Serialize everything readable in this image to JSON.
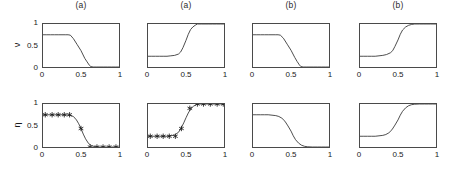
{
  "figure": {
    "rows": [
      {
        "ylabel": "ν"
      },
      {
        "ylabel": "η"
      }
    ],
    "xticks": [
      "0",
      "0.5",
      "1"
    ],
    "yticks": [
      "0",
      "0.5",
      "1"
    ],
    "columns": [
      {
        "title": "(a)"
      },
      {
        "title": "(b)"
      },
      {
        "title": "(c)"
      },
      {
        "title": "(d)"
      }
    ]
  },
  "chart_data": [
    {
      "type": "line",
      "title": "(a)",
      "xlabel": "",
      "ylabel": "ν",
      "xlim": [
        0,
        1
      ],
      "ylim": [
        0,
        1
      ],
      "xticks": [
        0,
        0.5,
        1
      ],
      "yticks": [
        0,
        0.5,
        1
      ],
      "grid": false,
      "legend": false,
      "markers": false,
      "series": [
        {
          "name": "ν",
          "x": [
            0.0,
            0.05,
            0.1,
            0.15,
            0.2,
            0.25,
            0.3,
            0.33,
            0.36,
            0.4,
            0.45,
            0.5,
            0.55,
            0.58,
            0.61,
            0.63,
            0.66,
            0.7,
            0.75,
            0.8,
            0.85,
            0.9,
            0.95,
            1.0
          ],
          "y": [
            0.75,
            0.75,
            0.75,
            0.75,
            0.75,
            0.75,
            0.75,
            0.75,
            0.74,
            0.66,
            0.52,
            0.38,
            0.2,
            0.12,
            0.04,
            0.01,
            0.0,
            0.0,
            0.0,
            0.0,
            0.0,
            0.0,
            0.0,
            0.0
          ]
        }
      ]
    },
    {
      "type": "line",
      "title": "(a)",
      "xlabel": "",
      "ylabel": "η",
      "xlim": [
        0,
        1
      ],
      "ylim": [
        0,
        1
      ],
      "xticks": [
        0,
        0.5,
        1
      ],
      "yticks": [
        0,
        0.5,
        1
      ],
      "grid": false,
      "legend": false,
      "markers": false,
      "series": [
        {
          "name": "η",
          "x": [
            0.0,
            0.05,
            0.1,
            0.15,
            0.2,
            0.25,
            0.3,
            0.35,
            0.4,
            0.43,
            0.46,
            0.5,
            0.53,
            0.56,
            0.59,
            0.62,
            0.65,
            0.7,
            0.75,
            0.8,
            0.85,
            0.9,
            0.95,
            1.0
          ],
          "y": [
            0.25,
            0.25,
            0.25,
            0.25,
            0.25,
            0.25,
            0.26,
            0.27,
            0.3,
            0.35,
            0.45,
            0.62,
            0.76,
            0.87,
            0.93,
            0.97,
            1.0,
            1.0,
            1.0,
            1.0,
            1.0,
            1.0,
            1.0,
            1.0
          ]
        }
      ]
    },
    {
      "type": "line",
      "title": "(b)",
      "xlabel": "",
      "ylabel": "ν",
      "xlim": [
        0,
        1
      ],
      "ylim": [
        0,
        1
      ],
      "xticks": [
        0,
        0.5,
        1
      ],
      "yticks": [
        0,
        0.5,
        1
      ],
      "grid": false,
      "legend": false,
      "markers": false,
      "series": [
        {
          "name": "ν",
          "x": [
            0.0,
            0.05,
            0.1,
            0.15,
            0.2,
            0.25,
            0.3,
            0.33,
            0.36,
            0.4,
            0.45,
            0.5,
            0.55,
            0.58,
            0.61,
            0.63,
            0.66,
            0.7,
            0.75,
            0.8,
            0.85,
            0.9,
            0.95,
            1.0
          ],
          "y": [
            0.75,
            0.75,
            0.75,
            0.75,
            0.75,
            0.75,
            0.75,
            0.75,
            0.74,
            0.67,
            0.53,
            0.39,
            0.22,
            0.13,
            0.05,
            0.01,
            0.0,
            0.0,
            0.0,
            0.0,
            0.0,
            0.0,
            0.0,
            0.0
          ]
        }
      ]
    },
    {
      "type": "line",
      "title": "(b)",
      "xlabel": "",
      "ylabel": "η",
      "xlim": [
        0,
        1
      ],
      "ylim": [
        0,
        1
      ],
      "xticks": [
        0,
        0.5,
        1
      ],
      "yticks": [
        0,
        0.5,
        1
      ],
      "grid": false,
      "legend": false,
      "markers": false,
      "series": [
        {
          "name": "η",
          "x": [
            0.0,
            0.05,
            0.1,
            0.15,
            0.2,
            0.25,
            0.3,
            0.35,
            0.4,
            0.43,
            0.46,
            0.5,
            0.53,
            0.56,
            0.6,
            0.64,
            0.68,
            0.72,
            0.78,
            0.83,
            0.88,
            0.93,
            1.0
          ],
          "y": [
            0.25,
            0.25,
            0.25,
            0.25,
            0.25,
            0.26,
            0.27,
            0.29,
            0.33,
            0.38,
            0.48,
            0.63,
            0.76,
            0.86,
            0.93,
            0.97,
            0.99,
            1.0,
            1.0,
            1.0,
            1.0,
            1.0,
            1.0
          ]
        }
      ]
    },
    {
      "type": "line",
      "title": "(c)",
      "xlabel": "",
      "ylabel": "ν",
      "xlim": [
        0,
        1
      ],
      "ylim": [
        0,
        1
      ],
      "xticks": [
        0,
        0.5,
        1
      ],
      "yticks": [
        0,
        0.5,
        1
      ],
      "grid": false,
      "legend": false,
      "markers": true,
      "marker_style": "asterisk",
      "series": [
        {
          "name": "ν",
          "x": [
            0.0,
            0.05,
            0.1,
            0.15,
            0.2,
            0.25,
            0.3,
            0.35,
            0.4,
            0.44,
            0.47,
            0.5,
            0.53,
            0.56,
            0.6,
            0.64,
            0.7,
            0.75,
            0.8,
            0.85,
            0.9,
            0.95,
            1.0
          ],
          "y": [
            0.75,
            0.75,
            0.75,
            0.75,
            0.75,
            0.75,
            0.75,
            0.74,
            0.71,
            0.63,
            0.54,
            0.43,
            0.3,
            0.19,
            0.08,
            0.03,
            0.0,
            0.0,
            0.0,
            0.0,
            0.0,
            0.0,
            0.0
          ],
          "marker_x": [
            0.03,
            0.12,
            0.2,
            0.28,
            0.35,
            0.5,
            0.62,
            0.71,
            0.79,
            0.87,
            0.96
          ],
          "marker_y": [
            0.75,
            0.75,
            0.75,
            0.75,
            0.75,
            0.43,
            0.0,
            0.0,
            0.0,
            0.0,
            0.0
          ]
        }
      ]
    },
    {
      "type": "line",
      "title": "(c)",
      "xlabel": "",
      "ylabel": "η",
      "xlim": [
        0,
        1
      ],
      "ylim": [
        0,
        1
      ],
      "xticks": [
        0,
        0.5,
        1
      ],
      "yticks": [
        0,
        0.5,
        1
      ],
      "grid": false,
      "legend": false,
      "markers": true,
      "marker_style": "asterisk",
      "series": [
        {
          "name": "η",
          "x": [
            0.0,
            0.05,
            0.1,
            0.15,
            0.2,
            0.25,
            0.3,
            0.35,
            0.4,
            0.43,
            0.47,
            0.5,
            0.53,
            0.56,
            0.6,
            0.64,
            0.68,
            0.75,
            0.8,
            0.85,
            0.9,
            0.95,
            1.0
          ],
          "y": [
            0.25,
            0.25,
            0.25,
            0.25,
            0.25,
            0.25,
            0.26,
            0.28,
            0.34,
            0.42,
            0.56,
            0.68,
            0.79,
            0.88,
            0.95,
            0.99,
            1.0,
            1.0,
            1.0,
            1.0,
            1.0,
            1.0,
            1.0
          ],
          "marker_x": [
            0.03,
            0.12,
            0.2,
            0.28,
            0.36,
            0.44,
            0.55,
            0.65,
            0.73,
            0.82,
            0.91,
            0.99
          ],
          "marker_y": [
            0.25,
            0.25,
            0.25,
            0.25,
            0.25,
            0.43,
            0.9,
            1.0,
            1.0,
            1.0,
            1.0,
            1.0
          ]
        }
      ]
    },
    {
      "type": "line",
      "title": "(d)",
      "xlabel": "",
      "ylabel": "ν",
      "xlim": [
        0,
        1
      ],
      "ylim": [
        0,
        1
      ],
      "xticks": [
        0,
        0.5,
        1
      ],
      "yticks": [
        0,
        0.5,
        1
      ],
      "grid": false,
      "legend": false,
      "markers": false,
      "series": [
        {
          "name": "ν",
          "x": [
            0.0,
            0.05,
            0.1,
            0.15,
            0.2,
            0.25,
            0.3,
            0.34,
            0.38,
            0.42,
            0.46,
            0.5,
            0.53,
            0.56,
            0.6,
            0.64,
            0.68,
            0.72,
            0.78,
            0.85,
            0.9,
            0.95,
            1.0
          ],
          "y": [
            0.75,
            0.75,
            0.75,
            0.75,
            0.75,
            0.74,
            0.73,
            0.71,
            0.67,
            0.6,
            0.49,
            0.37,
            0.26,
            0.17,
            0.09,
            0.04,
            0.015,
            0.005,
            0.0,
            0.0,
            0.0,
            0.0,
            0.0
          ]
        }
      ]
    },
    {
      "type": "line",
      "title": "(d)",
      "xlabel": "",
      "ylabel": "η",
      "xlim": [
        0,
        1
      ],
      "ylim": [
        0,
        1
      ],
      "xticks": [
        0,
        0.5,
        1
      ],
      "yticks": [
        0,
        0.5,
        1
      ],
      "grid": false,
      "legend": false,
      "markers": false,
      "series": [
        {
          "name": "η",
          "x": [
            0.0,
            0.05,
            0.1,
            0.15,
            0.2,
            0.25,
            0.3,
            0.34,
            0.38,
            0.42,
            0.46,
            0.5,
            0.53,
            0.56,
            0.6,
            0.64,
            0.68,
            0.72,
            0.78,
            0.85,
            0.9,
            0.95,
            1.0
          ],
          "y": [
            0.25,
            0.25,
            0.25,
            0.25,
            0.25,
            0.26,
            0.27,
            0.29,
            0.33,
            0.4,
            0.51,
            0.63,
            0.74,
            0.83,
            0.91,
            0.96,
            0.985,
            0.995,
            1.0,
            1.0,
            1.0,
            1.0,
            1.0
          ]
        }
      ]
    }
  ]
}
